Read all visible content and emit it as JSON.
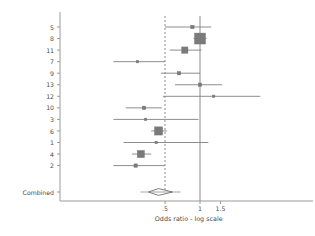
{
  "chart_data": {
    "type": "forest",
    "title": "",
    "xlabel": "Odds ratio - log scale",
    "ylabel": "",
    "xticks": [
      0.5,
      1,
      1.5
    ],
    "xticklabels": [
      ".5",
      "1",
      "1.5"
    ],
    "xlim": [
      0.17,
      2.6
    ],
    "scale": "log",
    "reference_line": 1,
    "dashed_line": 0.5,
    "categories": [
      "5",
      "8",
      "11",
      "7",
      "9",
      "13",
      "12",
      "10",
      "3",
      "6",
      "1",
      "4",
      "2"
    ],
    "summary_label": "Combined",
    "studies": [
      {
        "label": "5",
        "or": 0.86,
        "lo": 0.5,
        "hi": 1.25,
        "weight": 2
      },
      {
        "label": "8",
        "or": 1.0,
        "lo": 0.88,
        "hi": 1.14,
        "weight": 10
      },
      {
        "label": "11",
        "or": 0.74,
        "lo": 0.55,
        "hi": 1.03,
        "weight": 5
      },
      {
        "label": "7",
        "or": 0.29,
        "lo": 0.18,
        "hi": 0.5,
        "weight": 1
      },
      {
        "label": "9",
        "or": 0.66,
        "lo": 0.46,
        "hi": 1.0,
        "weight": 2
      },
      {
        "label": "13",
        "or": 1.0,
        "lo": 0.61,
        "hi": 1.55,
        "weight": 2
      },
      {
        "label": "12",
        "or": 1.31,
        "lo": 0.48,
        "hi": 3.3,
        "weight": 1
      },
      {
        "label": "10",
        "or": 0.33,
        "lo": 0.23,
        "hi": 0.47,
        "weight": 2
      },
      {
        "label": "3",
        "or": 0.34,
        "lo": 0.18,
        "hi": 0.97,
        "weight": 1
      },
      {
        "label": "6",
        "or": 0.44,
        "lo": 0.38,
        "hi": 0.52,
        "weight": 7
      },
      {
        "label": "1",
        "or": 0.42,
        "lo": 0.22,
        "hi": 1.18,
        "weight": 1
      },
      {
        "label": "4",
        "or": 0.31,
        "lo": 0.26,
        "hi": 0.38,
        "weight": 6
      },
      {
        "label": "2",
        "or": 0.28,
        "lo": 0.18,
        "hi": 0.5,
        "weight": 2
      }
    ],
    "summary": {
      "label": "Combined",
      "or": 0.44,
      "lo": 0.36,
      "hi": 0.58
    },
    "legend": [],
    "grid": false
  },
  "style": {
    "marker_color": "#7a7a7a",
    "line_color": "#808080",
    "axis_color": "#9a9a9a",
    "text_color": "#4a4a4a",
    "reference_color": "#8c8c8c",
    "dashed_color": "#8c8c8c",
    "background": "#ffffff"
  }
}
